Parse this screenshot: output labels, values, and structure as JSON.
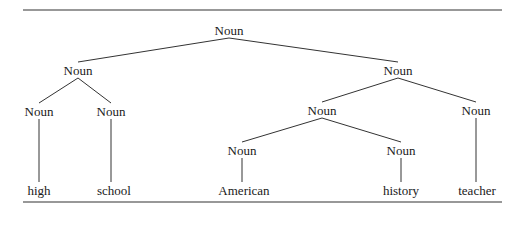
{
  "diagram": {
    "type": "parse-tree",
    "nodes": [
      {
        "id": "n0",
        "label": "Noun",
        "x": 229,
        "y": 30
      },
      {
        "id": "n1",
        "label": "Noun",
        "x": 78,
        "y": 70
      },
      {
        "id": "n2",
        "label": "Noun",
        "x": 398,
        "y": 70
      },
      {
        "id": "n3",
        "label": "Noun",
        "x": 39,
        "y": 111
      },
      {
        "id": "n4",
        "label": "Noun",
        "x": 111,
        "y": 111
      },
      {
        "id": "n5",
        "label": "Noun",
        "x": 322,
        "y": 110
      },
      {
        "id": "n6",
        "label": "Noun",
        "x": 476,
        "y": 110
      },
      {
        "id": "n7",
        "label": "Noun",
        "x": 242,
        "y": 150
      },
      {
        "id": "n8",
        "label": "Noun",
        "x": 401,
        "y": 150
      }
    ],
    "words": [
      {
        "id": "w0",
        "label": "high",
        "x": 39,
        "y": 190
      },
      {
        "id": "w1",
        "label": "school",
        "x": 114,
        "y": 190
      },
      {
        "id": "w2",
        "label": "American",
        "x": 244,
        "y": 190
      },
      {
        "id": "w3",
        "label": "history",
        "x": 401,
        "y": 190
      },
      {
        "id": "w4",
        "label": "teacher",
        "x": 477,
        "y": 190
      }
    ],
    "edges": [
      [
        "n0",
        "n1"
      ],
      [
        "n0",
        "n2"
      ],
      [
        "n1",
        "n3"
      ],
      [
        "n1",
        "n4"
      ],
      [
        "n2",
        "n5"
      ],
      [
        "n2",
        "n6"
      ],
      [
        "n5",
        "n7"
      ],
      [
        "n5",
        "n8"
      ],
      [
        "n3",
        "w0"
      ],
      [
        "n4",
        "w1"
      ],
      [
        "n7",
        "w2"
      ],
      [
        "n8",
        "w3"
      ],
      [
        "n6",
        "w4"
      ]
    ],
    "rules": {
      "top_y": 10,
      "bottom_y": 202,
      "x1": 23,
      "x2": 502
    },
    "line_color": "#333333"
  }
}
